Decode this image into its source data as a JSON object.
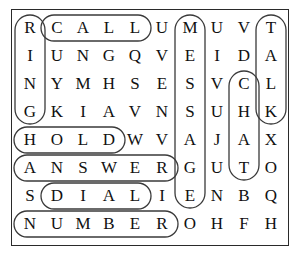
{
  "puzzle": {
    "type": "word-search",
    "rows": 8,
    "cols": 10,
    "grid": [
      [
        "R",
        "C",
        "A",
        "L",
        "L",
        "U",
        "M",
        "U",
        "V",
        "T"
      ],
      [
        "I",
        "U",
        "N",
        "G",
        "Q",
        "V",
        "E",
        "I",
        "D",
        "A"
      ],
      [
        "N",
        "Y",
        "M",
        "H",
        "S",
        "E",
        "S",
        "V",
        "C",
        "L"
      ],
      [
        "G",
        "K",
        "I",
        "A",
        "V",
        "N",
        "S",
        "U",
        "H",
        "K"
      ],
      [
        "H",
        "O",
        "L",
        "D",
        "W",
        "V",
        "A",
        "J",
        "A",
        "X"
      ],
      [
        "A",
        "N",
        "S",
        "W",
        "E",
        "R",
        "G",
        "U",
        "T",
        "O"
      ],
      [
        "S",
        "D",
        "I",
        "A",
        "L",
        "I",
        "E",
        "N",
        "B",
        "Q"
      ],
      [
        "N",
        "U",
        "M",
        "B",
        "E",
        "R",
        "O",
        "H",
        "F",
        "H"
      ]
    ],
    "found_words": [
      {
        "word": "RING",
        "orientation": "vertical",
        "start_row": 1,
        "start_col": 1,
        "length": 4
      },
      {
        "word": "CALL",
        "orientation": "horizontal",
        "start_row": 1,
        "start_col": 2,
        "length": 4
      },
      {
        "word": "MESSAGE",
        "orientation": "vertical",
        "start_row": 1,
        "start_col": 7,
        "length": 7
      },
      {
        "word": "TALK",
        "orientation": "vertical",
        "start_row": 1,
        "start_col": 10,
        "length": 4
      },
      {
        "word": "CHAT",
        "orientation": "vertical",
        "start_row": 3,
        "start_col": 9,
        "length": 4
      },
      {
        "word": "HOLD",
        "orientation": "horizontal",
        "start_row": 5,
        "start_col": 1,
        "length": 4
      },
      {
        "word": "ANSWER",
        "orientation": "horizontal",
        "start_row": 6,
        "start_col": 1,
        "length": 6
      },
      {
        "word": "DIAL",
        "orientation": "horizontal",
        "start_row": 7,
        "start_col": 2,
        "length": 4
      },
      {
        "word": "NUMBER",
        "orientation": "horizontal",
        "start_row": 8,
        "start_col": 1,
        "length": 6
      }
    ],
    "colors": {
      "letter": "#111111",
      "loop_stroke": "#3a3a3a",
      "frame_border": "#2a2a2a",
      "background": "#ffffff"
    }
  }
}
